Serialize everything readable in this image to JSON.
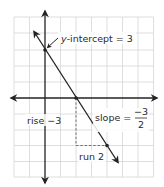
{
  "diagram": {
    "type": "coordinate-graph-line",
    "colors": {
      "grid": "#d6d6d6",
      "grid_border": "#cfcfcf",
      "axis": "#222222",
      "line": "#222222",
      "guide": "#555555",
      "text": "#2a2a2a",
      "background": "#ffffff"
    },
    "grid": {
      "columns": 9,
      "rows": 10,
      "x_origin_col": 2,
      "y_origin_row": 5
    },
    "line": {
      "equation_slope": "-3/2",
      "y_intercept": 3,
      "x_intercept": 2,
      "points": [
        [
          0,
          3
        ],
        [
          2,
          0
        ],
        [
          4,
          -3
        ]
      ]
    },
    "labels": {
      "y_intercept": {
        "var": "y",
        "text": "-intercept = 3"
      },
      "slope": {
        "text": "slope =",
        "numerator": "−3",
        "denominator": "2"
      },
      "rise": {
        "text": "rise −3"
      },
      "run": {
        "text": "run 2"
      }
    }
  }
}
